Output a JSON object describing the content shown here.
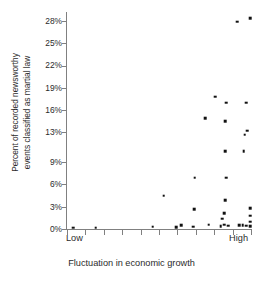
{
  "chart_data": {
    "type": "scatter",
    "title": "",
    "xlabel": "Fluctuation in economic growth",
    "ylabel": "Percent of recorded newsworthy events classified as martial law",
    "ylabel_line1": "Percent of recorded newsworthy",
    "ylabel_line2": "events classified as martial law",
    "ytick_labels": [
      "0%",
      "3%",
      "6%",
      "9%",
      "13%",
      "16%",
      "19%",
      "22%",
      "25%",
      "28%"
    ],
    "ytick_values": [
      0,
      3,
      6,
      9,
      13,
      16,
      19,
      22,
      25,
      28
    ],
    "ylim": [
      0,
      29.2
    ],
    "grid": false,
    "legend": false,
    "xlim": [
      0,
      10
    ],
    "x_axis_type": "ordinal-scale",
    "xtick_count": 11,
    "x_low_label": "Low",
    "x_high_label": "High",
    "point_color": "#111111",
    "axis_color": "#808080",
    "points": [
      {
        "x": 0.35,
        "y": 0.2
      },
      {
        "x": 1.55,
        "y": 0.2
      },
      {
        "x": 4.65,
        "y": 0.3
      },
      {
        "x": 5.95,
        "y": 0.25
      },
      {
        "x": 6.2,
        "y": 0.55
      },
      {
        "x": 6.85,
        "y": 0.3
      },
      {
        "x": 7.7,
        "y": 0.6
      },
      {
        "x": 8.35,
        "y": 0.35
      },
      {
        "x": 8.55,
        "y": 0.6
      },
      {
        "x": 8.75,
        "y": 0.45
      },
      {
        "x": 9.35,
        "y": 0.5
      },
      {
        "x": 9.55,
        "y": 0.55
      },
      {
        "x": 9.75,
        "y": 0.45
      },
      {
        "x": 9.95,
        "y": 0.35
      },
      {
        "x": 5.25,
        "y": 4.5
      },
      {
        "x": 8.45,
        "y": 1.4
      },
      {
        "x": 8.55,
        "y": 2.1
      },
      {
        "x": 9.95,
        "y": 1.0
      },
      {
        "x": 9.95,
        "y": 1.8
      },
      {
        "x": 9.95,
        "y": 2.8
      },
      {
        "x": 8.6,
        "y": 3.9
      },
      {
        "x": 6.9,
        "y": 2.7
      },
      {
        "x": 6.95,
        "y": 6.9
      },
      {
        "x": 8.65,
        "y": 6.9
      },
      {
        "x": 8.6,
        "y": 10.5
      },
      {
        "x": 9.6,
        "y": 10.5
      },
      {
        "x": 9.65,
        "y": 12.7
      },
      {
        "x": 9.8,
        "y": 13.2
      },
      {
        "x": 8.6,
        "y": 14.5
      },
      {
        "x": 7.5,
        "y": 14.9
      },
      {
        "x": 8.65,
        "y": 17.0
      },
      {
        "x": 9.75,
        "y": 17.0
      },
      {
        "x": 8.05,
        "y": 17.8
      },
      {
        "x": 9.25,
        "y": 27.9
      },
      {
        "x": 9.95,
        "y": 28.4
      }
    ]
  }
}
